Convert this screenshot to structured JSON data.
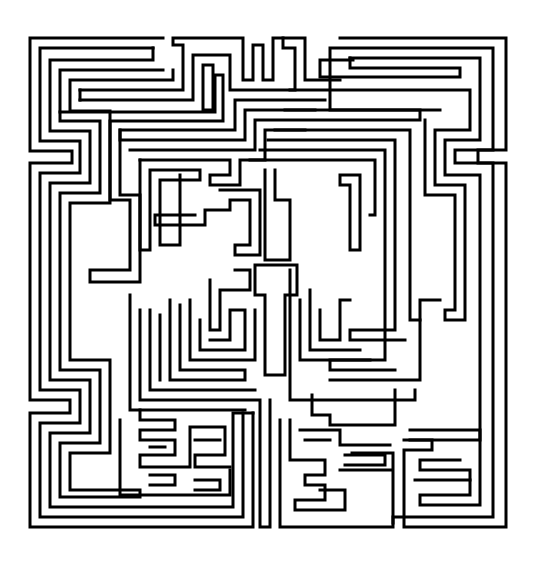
{
  "colors": {
    "wall": "#000000",
    "background": "#ffffff"
  },
  "maze": {
    "walls": [
      "163,38 30,38 30,151 72,151 72,163 30,163 30,400 70,400 70,413 30,413 30,527 253,527 253,413",
      "153,48 40,48 40,141 80,141 80,173 40,173 40,390 80,390 80,423 40,423 40,517 243,517 243,413",
      "153,48 153,60 50,60 50,131 90,131 90,183 50,183 50,380 90,380 90,433 50,433 50,507 233,507 233,413 253,413",
      "163,70 60,70 60,121 100,121 100,193 60,193 60,370 100,370 100,443 60,443 60,497 140,497 140,490 70,490 70,453 110,453 110,360 70,360 70,203 110,203 110,111 70,111 70,80 173,80 173,70",
      "80,90 183,90 183,45 173,45 173,38 243,38 243,80 253,80 253,45 263,45 263,80 273,80 273,38 305,38 305,80 340,80",
      "80,100 193,100 193,55 230,55 230,90 295,90 295,48 283,48 283,38",
      "80,90 80,100",
      "203,110 203,65 213,65 213,110 203,110",
      "60,112 215,112 215,75 223,75 223,121 110,121 110,200 130,200 130,270 90,270 90,282 140,282 140,195 120,195 120,130 235,130 235,100 325,100",
      "120,130 120,140 245,140 245,110 315,110",
      "130,150 255,150 255,120 420,120 420,110 330,110 330,48 493,48 493,150 455,150 455,163 493,163 493,517 393,517 393,523",
      "140,160 230,160 230,175 210,175 210,185 240,185 240,160 265,160 265,130 305,130",
      "140,160 140,250 150,250 150,170 200,170 200,180 160,180 160,245 180,245 180,175",
      "340,38 506,38 506,150 478,150 478,163 506,163 506,527 404,527 404,450 432,450 432,440 404,440",
      "350,58 480,58 480,140 445,140 445,175 480,175 480,505 420,505 420,495 470,495 470,470 420,470 420,460 460,460",
      "350,58 350,68 460,68 460,77 320,77 320,60 353,60",
      "290,90 470,90 470,130 435,130 435,185 465,185 465,320 445,320 445,310 455,310 455,195 425,195 425,120",
      "285,110 440,110",
      "275,130 410,130 410,320 420,320",
      "268,140 395,140 395,330 350,330 350,340 405,340",
      "260,150 385,150 385,360 330,360 330,370 395,370",
      "250,160 375,160 375,215 370,215",
      "340,175 360,175 360,250 350,250 350,185 340,185 340,175",
      "195,215 155,215 155,225 205,225 205,210 230,210 230,200 250,200 250,245 235,245 235,255 260,255 260,190 220,190",
      "265,170 265,260 290,260 290,200 275,200 275,170",
      "255,265 255,295 265,295 265,375 285,375 285,295 297,295 297,265 255,265",
      "210,280 210,330 220,330 220,290 250,290 250,270 235,270",
      "200,320 200,350 245,350 245,310 230,310 230,340 210,340",
      "190,300 190,360 255,360 255,310",
      "180,305 180,370 245,370 245,380 170,380 170,300",
      "150,310 150,390 255,390",
      "140,310 140,400 260,400 260,527 270,527 270,400",
      "160,315 160,380",
      "130,295 130,410 245,410",
      "280,420 280,527 393,527 393,453 352,453",
      "290,420 290,460 325,460 325,475 305,475 305,485 325,485 325,500 295,500 295,510 345,510 345,490 320,490",
      "300,430 340,430 340,445 390,445",
      "305,440 330,440",
      "312,395 312,415 330,415 330,425 395,425 395,390",
      "320,310 320,340 340,340 340,300 350,300",
      "300,300 300,360 370,360",
      "310,290 310,350 360,350",
      "290,270 290,400 415,400 415,390",
      "330,380 420,380 420,300 440,300",
      "345,455 385,455 385,465 345,465",
      "340,470 392,470",
      "410,430 480,430 480,440 410,440",
      "415,480 470,480",
      "140,410 140,420 175,420 175,430 140,430 140,440 175,440 175,455 140,455 140,467 190,467 190,427 225,427 225,455 195,455 195,467 230,467",
      "120,420 120,495 230,495 230,470",
      "150,475 175,475 175,485 150,485",
      "195,480 220,480 220,490 195,490",
      "150,447 165,447",
      "195,440 220,440"
    ]
  }
}
